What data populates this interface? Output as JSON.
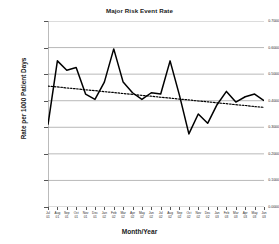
{
  "chart_data": {
    "type": "line",
    "title": "Major Risk Event Rate",
    "xlabel": "Month/Year",
    "ylabel": "Rate per 1000 Patient Days",
    "grid": true,
    "legend": "none",
    "ylim": [
      0.0,
      0.7
    ],
    "ytick_labels": [
      "0.7000",
      "0.6000",
      "0.5000",
      "0.4000",
      "0.3000",
      "0.2000",
      "0.1000",
      "0.0000"
    ],
    "ytick_values": [
      0.7,
      0.6,
      0.5,
      0.4,
      0.3,
      0.2,
      0.1,
      0.0
    ],
    "categories": [
      "Jul 01",
      "Aug 01",
      "Sep 01",
      "Oct 01",
      "Nov 01",
      "Dec 01",
      "Jan 02",
      "Feb 02",
      "Mar 02",
      "Apr 02",
      "May 02",
      "Jun 02",
      "Jul 02",
      "Aug 02",
      "Sep 02",
      "Oct 02",
      "Nov 02",
      "Dec 02",
      "Jan 03",
      "Feb 03",
      "Mar 03",
      "Apr 03",
      "May 03",
      "Jun 03"
    ],
    "xtick_months": [
      "Jul",
      "Aug",
      "Sep",
      "Oct",
      "Nov",
      "Dec",
      "Jan",
      "Feb",
      "Mar",
      "Apr",
      "May",
      "Jun",
      "Jul",
      "Aug",
      "Sep",
      "Oct",
      "Nov",
      "Dec",
      "Jan",
      "Feb",
      "Mar",
      "Apr",
      "May",
      "Jun"
    ],
    "xtick_years": [
      "01",
      "01",
      "01",
      "01",
      "01",
      "01",
      "02",
      "02",
      "02",
      "02",
      "02",
      "02",
      "02",
      "02",
      "02",
      "02",
      "02",
      "02",
      "03",
      "03",
      "03",
      "03",
      "03",
      "03"
    ],
    "series": [
      {
        "name": "Major Risk Event Rate",
        "style": "solid",
        "color": "#000000",
        "values": [
          0.31,
          0.55,
          0.515,
          0.525,
          0.425,
          0.405,
          0.47,
          0.595,
          0.47,
          0.43,
          0.405,
          0.43,
          0.425,
          0.55,
          0.42,
          0.275,
          0.35,
          0.315,
          0.385,
          0.435,
          0.395,
          0.415,
          0.425,
          0.4
        ]
      },
      {
        "name": "Trend",
        "style": "dotted",
        "color": "#000000",
        "values": [
          0.455,
          0.452,
          0.448,
          0.445,
          0.441,
          0.438,
          0.434,
          0.431,
          0.427,
          0.424,
          0.42,
          0.417,
          0.413,
          0.41,
          0.406,
          0.403,
          0.399,
          0.396,
          0.392,
          0.389,
          0.385,
          0.382,
          0.378,
          0.375
        ]
      }
    ]
  }
}
